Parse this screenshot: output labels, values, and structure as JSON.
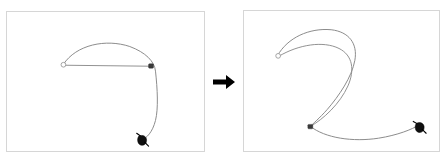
{
  "figure": {
    "background_color": "#ffffff",
    "width": 448,
    "height": 164
  },
  "transition": {
    "arrow_icon": "right-arrow-icon",
    "arrow_color": "#000000",
    "label": ""
  },
  "panels": [
    {
      "id": "before",
      "caption": "",
      "frame_color": "#d6d6d6",
      "rope_color": "#8a8a8a",
      "description": "Rope forms a wide arch from a free left end, over the top, down through a pinned node and sweeping down to the gripper near the bottom center.",
      "markers": {
        "free_end": {
          "label": "",
          "x": 62,
          "y": 56
        },
        "node": {
          "label": "",
          "x": 143,
          "y": 55
        },
        "gripper": {
          "label": "",
          "x": 136,
          "y": 129
        }
      },
      "strokes": [
        {
          "name": "rope-arch",
          "d": "M 57 53 C 70 33 100 27 124 35 C 140 41 149 50 150 60 C 152 78 153 98 150 110 C 147 122 141 128 137 129"
        },
        {
          "name": "rope-chord",
          "d": "M 58 54 L 145 55"
        }
      ]
    },
    {
      "id": "after",
      "caption": "",
      "frame_color": "#d6d6d6",
      "rope_color": "#8a8a8a",
      "description": "Rope is pulled into an S / question-mark shape: free end upper left, large loop curving right and down to a pinned node, then a long tail sweeping right to the gripper at lower right.",
      "markers": {
        "free_end": {
          "label": "",
          "x": 36,
          "y": 47
        },
        "node": {
          "label": "",
          "x": 67,
          "y": 117
        },
        "gripper": {
          "label": "",
          "x": 177,
          "y": 116
        }
      },
      "strokes": [
        {
          "name": "rope-upper-arc",
          "d": "M 34 45 C 44 27 66 17 88 19 C 106 21 115 33 112 50 C 109 67 96 86 84 100 C 76 109 70 114 67 117"
        },
        {
          "name": "rope-inner-loop",
          "d": "M 35 46 C 55 34 80 30 96 38 C 110 45 112 60 105 76 C 97 94 80 110 67 117"
        },
        {
          "name": "rope-tail",
          "d": "M 67 117 C 82 129 110 133 136 129 C 155 126 170 120 176 116"
        }
      ]
    }
  ]
}
